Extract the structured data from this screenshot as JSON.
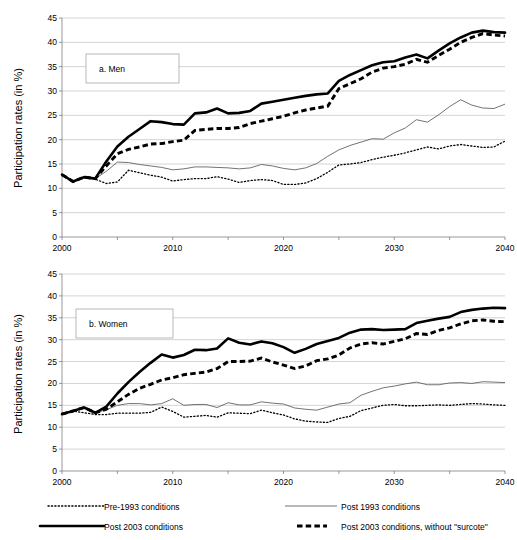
{
  "figure": {
    "ylabel": "Participation rates (in %)",
    "panels": [
      {
        "tag": "a. Men"
      },
      {
        "tag": "b. Women"
      }
    ]
  },
  "legend": {
    "items": [
      {
        "key": "pre1993",
        "label": "Pre-1993 conditions",
        "style": "dotted",
        "color": "#000000"
      },
      {
        "key": "post1993",
        "label": "Post 1993 conditions",
        "style": "thin-solid",
        "color": "#5a5a5a"
      },
      {
        "key": "post2003",
        "label": "Post 2003 conditions",
        "style": "thick-solid",
        "color": "#000000"
      },
      {
        "key": "post2003_nosurcote",
        "label": "Post 2003 conditions, without \"surcote\"",
        "style": "thick-dashed",
        "color": "#000000"
      }
    ]
  },
  "chart_data": [
    {
      "type": "line",
      "title": "a. Men",
      "xlabel": "",
      "ylabel": "Participation rates (in %)",
      "xlim": [
        2000,
        2040
      ],
      "ylim": [
        0,
        45
      ],
      "xticks": [
        2000,
        2010,
        2020,
        2030,
        2040
      ],
      "xminorticks": [
        2005,
        2015,
        2025,
        2035
      ],
      "yticks": [
        0,
        5,
        10,
        15,
        20,
        25,
        30,
        35,
        40,
        45
      ],
      "grid": true,
      "legend_position": "below-figure",
      "x": [
        2000,
        2001,
        2002,
        2003,
        2004,
        2005,
        2006,
        2007,
        2008,
        2009,
        2010,
        2011,
        2012,
        2013,
        2014,
        2015,
        2016,
        2017,
        2018,
        2019,
        2020,
        2021,
        2022,
        2023,
        2024,
        2025,
        2026,
        2027,
        2028,
        2029,
        2030,
        2031,
        2032,
        2033,
        2034,
        2035,
        2036,
        2037,
        2038,
        2039,
        2040
      ],
      "series": [
        {
          "name": "Pre-1993 conditions",
          "values": [
            12.8,
            11.4,
            12.3,
            11.9,
            11.0,
            11.3,
            13.7,
            13.2,
            12.7,
            12.3,
            11.5,
            11.8,
            12.0,
            12.0,
            12.4,
            11.9,
            11.2,
            11.6,
            11.8,
            11.6,
            10.8,
            10.8,
            11.1,
            12.0,
            13.3,
            14.8,
            15.0,
            15.3,
            15.9,
            16.4,
            16.8,
            17.3,
            17.9,
            18.5,
            18.1,
            18.7,
            19.0,
            18.7,
            18.4,
            18.5,
            19.7
          ]
        },
        {
          "name": "Post 1993 conditions",
          "values": [
            12.8,
            11.4,
            12.3,
            12.0,
            13.5,
            15.4,
            15.3,
            14.9,
            14.6,
            14.3,
            13.8,
            14.0,
            14.4,
            14.4,
            14.3,
            14.2,
            14.0,
            14.2,
            14.9,
            14.6,
            14.1,
            13.8,
            14.2,
            15.1,
            16.6,
            17.9,
            18.8,
            19.5,
            20.2,
            20.1,
            21.4,
            22.4,
            24.1,
            23.6,
            25.1,
            26.8,
            28.2,
            27.1,
            26.5,
            26.4,
            27.3
          ]
        },
        {
          "name": "Post 2003 conditions",
          "values": [
            12.8,
            11.4,
            12.3,
            12.0,
            15.5,
            18.6,
            20.6,
            22.2,
            23.8,
            23.6,
            23.2,
            23.1,
            25.4,
            25.6,
            26.4,
            25.4,
            25.5,
            25.9,
            27.4,
            27.8,
            28.2,
            28.6,
            29.0,
            29.3,
            29.5,
            32.1,
            33.3,
            34.3,
            35.3,
            35.9,
            36.1,
            36.9,
            37.5,
            36.7,
            38.3,
            39.8,
            41.0,
            42.0,
            42.4,
            42.1,
            42.0
          ]
        },
        {
          "name": "Post 2003 conditions, without \"surcote\"",
          "values": [
            12.8,
            11.4,
            12.3,
            12.0,
            14.6,
            17.1,
            18.0,
            18.5,
            19.1,
            19.2,
            19.6,
            19.9,
            21.9,
            22.1,
            22.3,
            22.3,
            22.5,
            23.3,
            23.8,
            24.3,
            24.8,
            25.5,
            26.1,
            26.5,
            26.9,
            30.5,
            31.5,
            32.5,
            33.9,
            34.7,
            35.0,
            35.5,
            36.5,
            35.9,
            37.3,
            38.6,
            40.0,
            41.0,
            41.8,
            41.5,
            41.3
          ]
        }
      ]
    },
    {
      "type": "line",
      "title": "b. Women",
      "xlabel": "",
      "ylabel": "Participation rates (in %)",
      "xlim": [
        2000,
        2040
      ],
      "ylim": [
        0,
        45
      ],
      "xticks": [
        2000,
        2010,
        2020,
        2030,
        2040
      ],
      "xminorticks": [
        2005,
        2015,
        2025,
        2035
      ],
      "yticks": [
        0,
        5,
        10,
        15,
        20,
        25,
        30,
        35,
        40,
        45
      ],
      "grid": true,
      "legend_position": "below-figure",
      "x": [
        2000,
        2001,
        2002,
        2003,
        2004,
        2005,
        2006,
        2007,
        2008,
        2009,
        2010,
        2011,
        2012,
        2013,
        2014,
        2015,
        2016,
        2017,
        2018,
        2019,
        2020,
        2021,
        2022,
        2023,
        2024,
        2025,
        2026,
        2027,
        2028,
        2029,
        2030,
        2031,
        2032,
        2033,
        2034,
        2035,
        2036,
        2037,
        2038,
        2039,
        2040
      ],
      "series": [
        {
          "name": "Pre-1993 conditions",
          "values": [
            13.0,
            13.7,
            13.3,
            12.9,
            12.9,
            13.2,
            13.2,
            13.2,
            13.4,
            14.6,
            13.6,
            12.3,
            12.5,
            12.7,
            12.3,
            13.3,
            13.2,
            13.1,
            13.9,
            13.3,
            12.8,
            11.9,
            11.4,
            11.2,
            11.1,
            12.0,
            12.5,
            13.8,
            14.4,
            15.0,
            15.2,
            14.9,
            14.9,
            15.0,
            15.1,
            15.0,
            15.2,
            15.4,
            15.3,
            15.1,
            15.0
          ]
        },
        {
          "name": "Post 1993 conditions",
          "values": [
            13.0,
            13.7,
            14.5,
            13.3,
            14.0,
            15.0,
            15.4,
            15.4,
            15.1,
            15.4,
            16.5,
            15.0,
            15.2,
            15.2,
            14.5,
            15.6,
            15.1,
            15.1,
            15.8,
            15.5,
            15.3,
            14.4,
            14.1,
            13.9,
            14.6,
            15.3,
            15.6,
            17.3,
            18.2,
            19.0,
            19.4,
            19.9,
            20.3,
            19.7,
            19.7,
            20.1,
            20.2,
            20.0,
            20.4,
            20.3,
            20.2
          ]
        },
        {
          "name": "Post 2003 conditions",
          "values": [
            13.0,
            13.7,
            14.5,
            13.3,
            14.7,
            17.7,
            20.3,
            22.6,
            24.7,
            26.6,
            25.9,
            26.5,
            27.7,
            27.6,
            28.0,
            30.3,
            29.3,
            28.9,
            29.6,
            29.2,
            28.3,
            27.0,
            27.9,
            29.0,
            29.7,
            30.4,
            31.6,
            32.3,
            32.4,
            32.2,
            32.3,
            32.4,
            33.8,
            34.3,
            34.8,
            35.2,
            36.3,
            36.8,
            37.1,
            37.3,
            37.2
          ]
        },
        {
          "name": "Post 2003 conditions, without \"surcote\"",
          "values": [
            13.0,
            13.7,
            14.5,
            13.3,
            14.1,
            15.8,
            17.5,
            18.9,
            19.8,
            20.8,
            21.3,
            22.0,
            22.3,
            22.6,
            23.4,
            25.0,
            25.0,
            25.1,
            25.8,
            24.9,
            24.2,
            23.4,
            24.0,
            25.2,
            25.6,
            26.5,
            28.1,
            29.0,
            29.3,
            29.0,
            29.6,
            30.2,
            31.4,
            31.2,
            32.1,
            32.7,
            33.6,
            34.3,
            34.5,
            34.2,
            34.1
          ]
        }
      ]
    }
  ]
}
